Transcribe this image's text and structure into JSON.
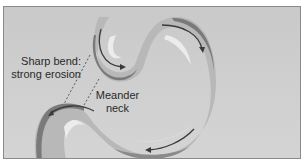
{
  "diagram": {
    "type": "meander-river",
    "labels": {
      "sharp_bend_line1": "Sharp bend:",
      "sharp_bend_line2": "strong erosion",
      "meander_neck_line1": "Meander",
      "meander_neck_line2": "neck"
    },
    "colors": {
      "background": "#cdcdcd",
      "river": "#b8b8b8",
      "outer_bank_erosion": "#7a7a7a",
      "inner_bank_deposit": "#ececec",
      "flow_arrow": "#3a3a3a",
      "border": "#8a8a8a",
      "text": "#2a2a2a"
    }
  }
}
